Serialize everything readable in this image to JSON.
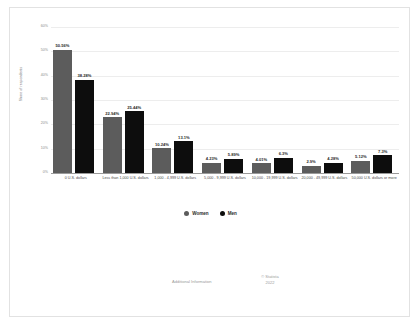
{
  "chart_data": {
    "type": "bar",
    "title": "",
    "xlabel": "",
    "ylabel": "Share of respondents",
    "ylim": [
      0,
      60
    ],
    "grid": true,
    "legend_position": "bottom",
    "categories": [
      "0 U.S. dollars",
      "Less than 1,000 U.S. dollars",
      "1,000 - 4,999 U.S. dollars",
      "5,000 - 9,999 U.S. dollars",
      "10,000 - 19,999 U.S. dollars",
      "20,000 - 49,999 U.S. dollars",
      "50,000 U.S. dollars or more"
    ],
    "series": [
      {
        "name": "Women",
        "color": "#5c5c5c",
        "values": [
          50.56,
          22.94,
          10.24,
          4.23,
          4.01,
          2.9,
          5.12
        ],
        "labels": [
          "50.56%",
          "22.94%",
          "10.24%",
          "4.23%",
          "4.01%",
          "2.9%",
          "5.12%"
        ]
      },
      {
        "name": "Men",
        "color": "#0d0d0d",
        "values": [
          38.28,
          25.44,
          13.1,
          5.89,
          6.3,
          4.28,
          7.3
        ],
        "labels": [
          "38.28%",
          "25.44%",
          "13.1%",
          "5.89%",
          "6.3%",
          "4.28%",
          "7.3%"
        ]
      }
    ],
    "yticks": [
      "0%",
      "10%",
      "20%",
      "30%",
      "40%",
      "50%",
      "60%"
    ],
    "ytick_values": [
      0,
      10,
      20,
      30,
      40,
      50,
      60
    ]
  },
  "footer": {
    "additional_information": "Additional Information",
    "credit_line1": "© Statista",
    "credit_line2": "2022"
  }
}
